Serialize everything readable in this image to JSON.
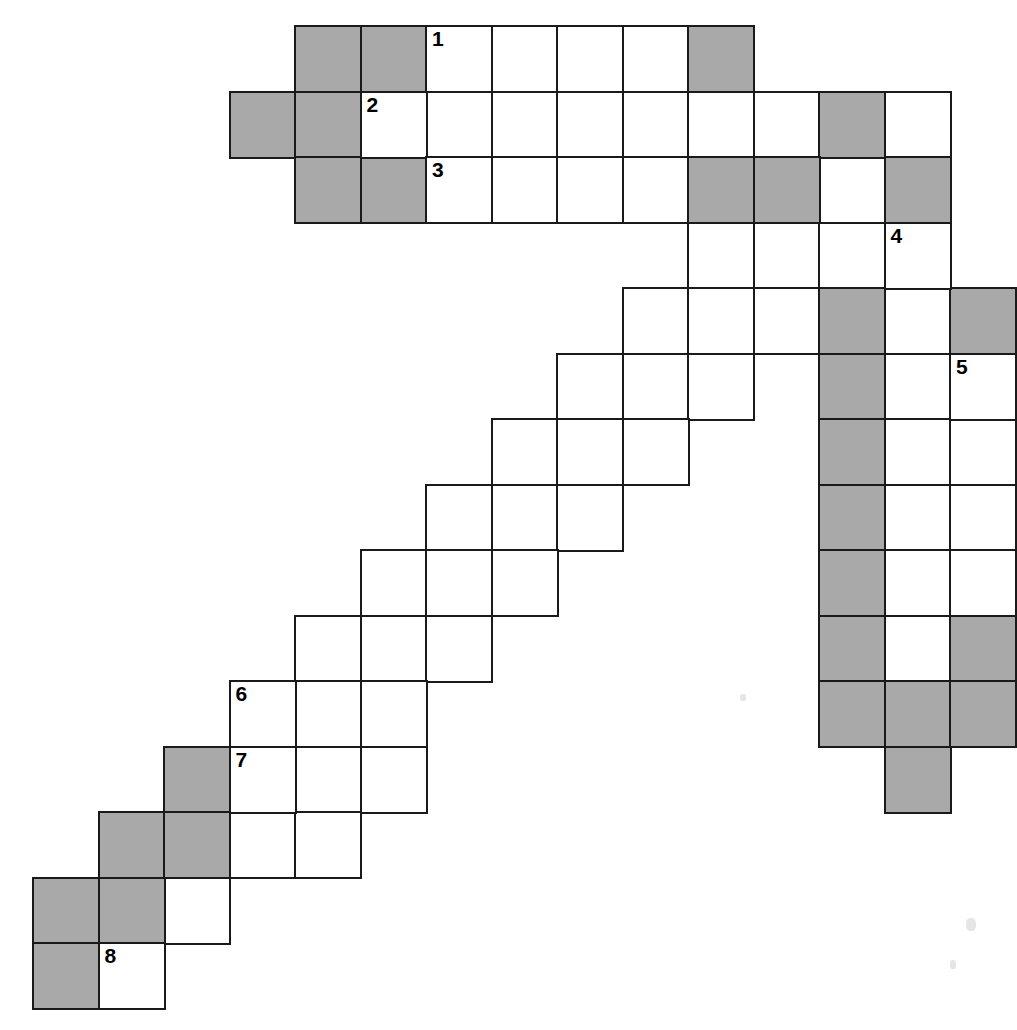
{
  "document": {
    "title": "Crossword Puzzle Grid",
    "kind": "blank-crossword-grid",
    "description": "Irregular staircase-shaped crossword grid with eight numbered entry squares"
  },
  "grid": {
    "cell_size": 65.5,
    "origin_x": 32,
    "origin_y": 25,
    "columns": 15,
    "rows": 16,
    "colors": {
      "fill_open": "#ffffff",
      "fill_blocked": "#a9a9a9",
      "border": "#1a1a1a",
      "page_background": "#ffffff",
      "number_text": "#000000"
    },
    "border_width": 2.5,
    "number_font_size": 21
  },
  "legend": {
    "open_label": "open square",
    "blocked_label": "blocked square",
    "numbered_label": "numbered entry square"
  },
  "clue_numbers": [
    "1",
    "2",
    "3",
    "4",
    "5",
    "6",
    "7",
    "8"
  ],
  "numbered_cells": [
    {
      "number": "1",
      "row": 0,
      "col": 6
    },
    {
      "number": "2",
      "row": 1,
      "col": 5
    },
    {
      "number": "3",
      "row": 2,
      "col": 6
    },
    {
      "number": "4",
      "row": 3,
      "col": 13
    },
    {
      "number": "5",
      "row": 5,
      "col": 14
    },
    {
      "number": "6",
      "row": 10,
      "col": 3
    },
    {
      "number": "7",
      "row": 11,
      "col": 3
    },
    {
      "number": "8",
      "row": 15,
      "col": 1
    }
  ],
  "cells": [
    {
      "row": 0,
      "col": 4,
      "state": "blocked"
    },
    {
      "row": 0,
      "col": 5,
      "state": "blocked"
    },
    {
      "row": 0,
      "col": 6,
      "state": "open",
      "number": "1"
    },
    {
      "row": 0,
      "col": 7,
      "state": "open"
    },
    {
      "row": 0,
      "col": 8,
      "state": "open"
    },
    {
      "row": 0,
      "col": 9,
      "state": "open"
    },
    {
      "row": 0,
      "col": 10,
      "state": "blocked"
    },
    {
      "row": 1,
      "col": 3,
      "state": "blocked"
    },
    {
      "row": 1,
      "col": 4,
      "state": "blocked"
    },
    {
      "row": 1,
      "col": 5,
      "state": "open",
      "number": "2"
    },
    {
      "row": 1,
      "col": 6,
      "state": "open"
    },
    {
      "row": 1,
      "col": 7,
      "state": "open"
    },
    {
      "row": 1,
      "col": 8,
      "state": "open"
    },
    {
      "row": 1,
      "col": 9,
      "state": "open"
    },
    {
      "row": 1,
      "col": 10,
      "state": "open"
    },
    {
      "row": 1,
      "col": 11,
      "state": "open"
    },
    {
      "row": 1,
      "col": 12,
      "state": "blocked"
    },
    {
      "row": 1,
      "col": 13,
      "state": "open"
    },
    {
      "row": 2,
      "col": 4,
      "state": "blocked"
    },
    {
      "row": 2,
      "col": 5,
      "state": "blocked"
    },
    {
      "row": 2,
      "col": 6,
      "state": "open",
      "number": "3"
    },
    {
      "row": 2,
      "col": 7,
      "state": "open"
    },
    {
      "row": 2,
      "col": 8,
      "state": "open"
    },
    {
      "row": 2,
      "col": 9,
      "state": "open"
    },
    {
      "row": 2,
      "col": 10,
      "state": "blocked"
    },
    {
      "row": 2,
      "col": 11,
      "state": "blocked"
    },
    {
      "row": 2,
      "col": 12,
      "state": "open"
    },
    {
      "row": 2,
      "col": 13,
      "state": "blocked"
    },
    {
      "row": 3,
      "col": 10,
      "state": "open"
    },
    {
      "row": 3,
      "col": 11,
      "state": "open"
    },
    {
      "row": 3,
      "col": 12,
      "state": "open"
    },
    {
      "row": 3,
      "col": 13,
      "state": "open",
      "number": "4"
    },
    {
      "row": 4,
      "col": 9,
      "state": "open"
    },
    {
      "row": 4,
      "col": 10,
      "state": "open"
    },
    {
      "row": 4,
      "col": 11,
      "state": "open"
    },
    {
      "row": 4,
      "col": 12,
      "state": "blocked"
    },
    {
      "row": 4,
      "col": 13,
      "state": "open"
    },
    {
      "row": 4,
      "col": 14,
      "state": "blocked"
    },
    {
      "row": 5,
      "col": 8,
      "state": "open"
    },
    {
      "row": 5,
      "col": 9,
      "state": "open"
    },
    {
      "row": 5,
      "col": 10,
      "state": "open"
    },
    {
      "row": 5,
      "col": 12,
      "state": "blocked"
    },
    {
      "row": 5,
      "col": 13,
      "state": "open"
    },
    {
      "row": 5,
      "col": 14,
      "state": "open",
      "number": "5"
    },
    {
      "row": 6,
      "col": 7,
      "state": "open"
    },
    {
      "row": 6,
      "col": 8,
      "state": "open"
    },
    {
      "row": 6,
      "col": 9,
      "state": "open"
    },
    {
      "row": 6,
      "col": 12,
      "state": "blocked"
    },
    {
      "row": 6,
      "col": 13,
      "state": "open"
    },
    {
      "row": 6,
      "col": 14,
      "state": "open"
    },
    {
      "row": 7,
      "col": 6,
      "state": "open"
    },
    {
      "row": 7,
      "col": 7,
      "state": "open"
    },
    {
      "row": 7,
      "col": 8,
      "state": "open"
    },
    {
      "row": 7,
      "col": 12,
      "state": "blocked"
    },
    {
      "row": 7,
      "col": 13,
      "state": "open"
    },
    {
      "row": 7,
      "col": 14,
      "state": "open"
    },
    {
      "row": 8,
      "col": 5,
      "state": "open"
    },
    {
      "row": 8,
      "col": 6,
      "state": "open"
    },
    {
      "row": 8,
      "col": 7,
      "state": "open"
    },
    {
      "row": 8,
      "col": 12,
      "state": "blocked"
    },
    {
      "row": 8,
      "col": 13,
      "state": "open"
    },
    {
      "row": 8,
      "col": 14,
      "state": "open"
    },
    {
      "row": 9,
      "col": 4,
      "state": "open"
    },
    {
      "row": 9,
      "col": 5,
      "state": "open"
    },
    {
      "row": 9,
      "col": 6,
      "state": "open"
    },
    {
      "row": 9,
      "col": 12,
      "state": "blocked"
    },
    {
      "row": 9,
      "col": 13,
      "state": "open"
    },
    {
      "row": 9,
      "col": 14,
      "state": "blocked"
    },
    {
      "row": 10,
      "col": 3,
      "state": "open",
      "number": "6"
    },
    {
      "row": 10,
      "col": 4,
      "state": "open"
    },
    {
      "row": 10,
      "col": 5,
      "state": "open"
    },
    {
      "row": 10,
      "col": 12,
      "state": "blocked"
    },
    {
      "row": 10,
      "col": 13,
      "state": "blocked"
    },
    {
      "row": 10,
      "col": 14,
      "state": "blocked"
    },
    {
      "row": 11,
      "col": 2,
      "state": "blocked"
    },
    {
      "row": 11,
      "col": 3,
      "state": "open",
      "number": "7"
    },
    {
      "row": 11,
      "col": 4,
      "state": "open"
    },
    {
      "row": 11,
      "col": 5,
      "state": "open"
    },
    {
      "row": 11,
      "col": 13,
      "state": "blocked"
    },
    {
      "row": 12,
      "col": 1,
      "state": "blocked"
    },
    {
      "row": 12,
      "col": 2,
      "state": "blocked"
    },
    {
      "row": 12,
      "col": 3,
      "state": "open"
    },
    {
      "row": 12,
      "col": 4,
      "state": "open"
    },
    {
      "row": 13,
      "col": 0,
      "state": "blocked"
    },
    {
      "row": 13,
      "col": 1,
      "state": "blocked"
    },
    {
      "row": 13,
      "col": 2,
      "state": "open"
    },
    {
      "row": 14,
      "col": 0,
      "state": "blocked"
    },
    {
      "row": 14,
      "col": 1,
      "state": "open",
      "number": "8"
    }
  ],
  "specks": [
    {
      "x": 962,
      "y": 612,
      "w": 7,
      "h": 26
    },
    {
      "x": 966,
      "y": 918,
      "w": 10,
      "h": 13
    },
    {
      "x": 950,
      "y": 960,
      "w": 6,
      "h": 9
    },
    {
      "x": 740,
      "y": 694,
      "w": 6,
      "h": 7
    }
  ]
}
